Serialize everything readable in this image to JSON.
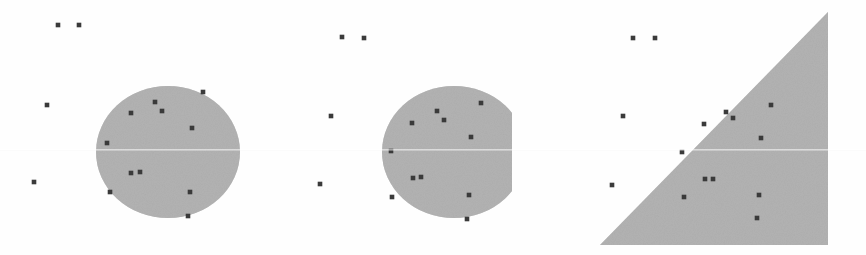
{
  "figure": {
    "width": 866,
    "height": 255,
    "background_color": "#fefefe",
    "shape_fill_color": "#b3b3b3",
    "marker_color": "#3a3a3a",
    "scanline_color": "#f2f2f2"
  },
  "chart_data": {
    "type": "scatter",
    "xlabel": "",
    "ylabel": "",
    "grid": false,
    "legend_position": "none",
    "panels": [
      {
        "name": "circle",
        "label": "",
        "shape": "circle",
        "shape_params": {
          "cx": 168,
          "cy": 152,
          "rx": 72,
          "ry": 66
        },
        "shape_fill": "#b3b3b3",
        "points_inside": [
          {
            "x": 203,
            "y": 92
          },
          {
            "x": 155,
            "y": 102
          },
          {
            "x": 162,
            "y": 111
          },
          {
            "x": 131,
            "y": 113
          },
          {
            "x": 192,
            "y": 128
          },
          {
            "x": 107,
            "y": 143
          },
          {
            "x": 131,
            "y": 173
          },
          {
            "x": 140,
            "y": 172
          },
          {
            "x": 110,
            "y": 192
          },
          {
            "x": 190,
            "y": 192
          },
          {
            "x": 188,
            "y": 216
          }
        ],
        "points_outside": [
          {
            "x": 58,
            "y": 25
          },
          {
            "x": 79,
            "y": 25
          },
          {
            "x": 47,
            "y": 105
          },
          {
            "x": 34,
            "y": 182
          }
        ]
      },
      {
        "name": "clipped-circle",
        "label": "",
        "shape": "circle-clipped",
        "shape_params": {
          "cx": 454,
          "cy": 152,
          "rx": 72,
          "ry": 66,
          "clip_right": 533,
          "clip_bottom": 244
        },
        "shape_fill": "#b3b3b3",
        "points_inside": [
          {
            "x": 481,
            "y": 103
          },
          {
            "x": 437,
            "y": 111
          },
          {
            "x": 444,
            "y": 120
          },
          {
            "x": 412,
            "y": 123
          },
          {
            "x": 471,
            "y": 137
          },
          {
            "x": 391,
            "y": 151
          },
          {
            "x": 413,
            "y": 178
          },
          {
            "x": 421,
            "y": 177
          },
          {
            "x": 392,
            "y": 197
          },
          {
            "x": 469,
            "y": 195
          },
          {
            "x": 467,
            "y": 219
          }
        ],
        "points_outside": [
          {
            "x": 342,
            "y": 37
          },
          {
            "x": 364,
            "y": 38
          },
          {
            "x": 331,
            "y": 116
          },
          {
            "x": 320,
            "y": 184
          }
        ]
      },
      {
        "name": "triangle",
        "label": "",
        "shape": "right-triangle",
        "shape_params": {
          "apex_x": 828,
          "apex_y": 12,
          "bottom_left_x": 600,
          "bottom_left_y": 245,
          "bottom_right_x": 828,
          "bottom_right_y": 245
        },
        "shape_fill": "#b3b3b3",
        "points_inside": [
          {
            "x": 771,
            "y": 105
          },
          {
            "x": 726,
            "y": 112
          },
          {
            "x": 733,
            "y": 118
          },
          {
            "x": 704,
            "y": 124
          },
          {
            "x": 761,
            "y": 138
          },
          {
            "x": 682,
            "y": 152
          },
          {
            "x": 705,
            "y": 179
          },
          {
            "x": 713,
            "y": 179
          },
          {
            "x": 684,
            "y": 197
          },
          {
            "x": 759,
            "y": 195
          },
          {
            "x": 757,
            "y": 218
          }
        ],
        "points_outside": [
          {
            "x": 633,
            "y": 38
          },
          {
            "x": 655,
            "y": 38
          },
          {
            "x": 623,
            "y": 116
          },
          {
            "x": 612,
            "y": 185
          }
        ]
      }
    ]
  }
}
